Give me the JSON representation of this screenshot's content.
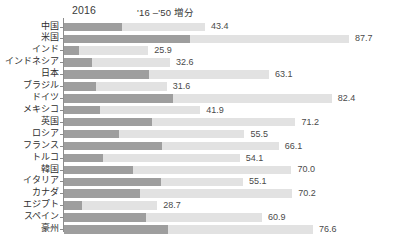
{
  "header": {
    "col_2016": "2016",
    "col_delta": "'16 –'50 増分"
  },
  "style": {
    "base_color": "#9e9e9e",
    "delta_color": "#e2e2e2",
    "axis_color": "#8d8d8d",
    "text_color": "#333333"
  },
  "chart_data": {
    "type": "bar",
    "orientation": "horizontal",
    "stacked": true,
    "title": "",
    "xlabel": "",
    "ylabel": "",
    "grid": false,
    "legend_position": "top",
    "xlim": [
      0,
      100
    ],
    "categories": [
      "中国",
      "米国",
      "インド",
      "インドネシア",
      "日本",
      "ブラジル",
      "ドイツ",
      "メキシコ",
      "英国",
      "ロシア",
      "フランス",
      "トルコ",
      "韓国",
      "イタリア",
      "カナダ",
      "エジプト",
      "スペイン",
      "豪州"
    ],
    "series": [
      {
        "name": "2016",
        "values": [
          17.7,
          38.7,
          4.5,
          8.6,
          26.0,
          9.7,
          33.4,
          11.1,
          27.1,
          16.8,
          30.3,
          11.9,
          21.1,
          29.7,
          23.3,
          5.6,
          25.2,
          32.0
        ]
      },
      {
        "name": "'16 –'50 増分",
        "values": [
          25.7,
          49.0,
          21.4,
          24.0,
          37.1,
          21.9,
          49.0,
          30.8,
          44.1,
          38.7,
          35.8,
          42.2,
          48.9,
          25.4,
          46.9,
          23.1,
          35.7,
          44.6
        ]
      }
    ],
    "totals": [
      43.4,
      87.7,
      25.9,
      32.6,
      63.1,
      31.6,
      82.4,
      41.9,
      71.2,
      55.5,
      66.1,
      54.1,
      70.0,
      55.1,
      70.2,
      28.7,
      60.9,
      76.6
    ],
    "total_labels": [
      "43.4",
      "87.7",
      "25.9",
      "32.6",
      "63.1",
      "31.6",
      "82.4",
      "41.9",
      "71.2",
      "55.5",
      "66.1",
      "54.1",
      "70.0",
      "55.1",
      "70.2",
      "28.7",
      "60.9",
      "76.6"
    ]
  }
}
